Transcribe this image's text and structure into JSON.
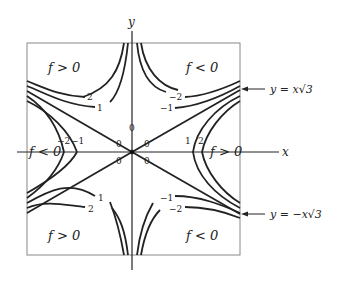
{
  "diagram": {
    "type": "contour-plot",
    "axes": {
      "x_label": "x",
      "y_label": "y"
    },
    "regions": [
      {
        "id": "top-left",
        "label": "f > 0"
      },
      {
        "id": "top-right",
        "label": "f < 0"
      },
      {
        "id": "left",
        "label": "f < 0"
      },
      {
        "id": "right",
        "label": "f > 0"
      },
      {
        "id": "bottom-left",
        "label": "f > 0"
      },
      {
        "id": "bottom-right",
        "label": "f < 0"
      }
    ],
    "contour_labels": {
      "tl_2": "2",
      "tl_1": "1",
      "tr_m2": "−2",
      "tr_m1": "−1",
      "l_m2": "−2",
      "l_m1": "−1",
      "r_1": "1",
      "r_2": "2",
      "bl_1": "1",
      "bl_2": "2",
      "br_m1": "−1",
      "br_m2": "−2",
      "zero_top": "0",
      "zero_ul": "0",
      "zero_ur": "0",
      "zero_ll": "0",
      "zero_lr": "0",
      "zero_cl": "0",
      "zero_cr": "0"
    },
    "annotations": {
      "upper_line": "y = x√3",
      "lower_line": "y = −x√3"
    },
    "contour_levels": [
      -2,
      -1,
      0,
      1,
      2
    ]
  }
}
